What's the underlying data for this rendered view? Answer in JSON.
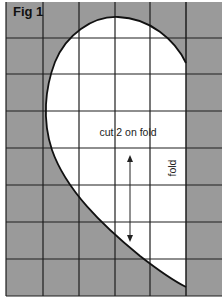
{
  "figure": {
    "title": "Fig 1",
    "pattern_label": "cut 2 on fold",
    "fold_label": "fold",
    "colors": {
      "background_shade": "#9a9a9a",
      "pattern_fill": "#ffffff",
      "grid_line": "#1e1e1e",
      "outline": "#111111"
    },
    "grid": {
      "columns": 6,
      "rows": 8,
      "vertical_lines_x": [
        6,
        43,
        79,
        115,
        150,
        186,
        222
      ],
      "horizontal_lines_y": [
        2,
        38,
        74,
        111,
        148,
        185,
        222,
        259,
        296
      ]
    },
    "grain_arrow": {
      "x": 130,
      "y1": 155,
      "y2": 242
    }
  }
}
